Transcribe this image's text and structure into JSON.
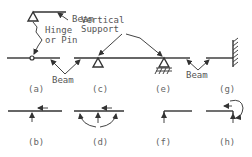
{
  "labels": {
    "beam_top": "Beam",
    "hinge_line1": "Hinge",
    "hinge_line2": "or Pin",
    "vertical_line1": "Vertical",
    "vertical_line2": "Support",
    "beam_mid": "Beam",
    "beam_right": "Beam"
  },
  "captions": {
    "a": "(a)",
    "b": "(b)",
    "c": "(c)",
    "d": "(d)",
    "e": "(e)",
    "f": "(f)",
    "g": "(g)",
    "h": "(h)"
  },
  "colors": {
    "line": "#333333",
    "text": "#555555",
    "background": "#ffffff"
  }
}
